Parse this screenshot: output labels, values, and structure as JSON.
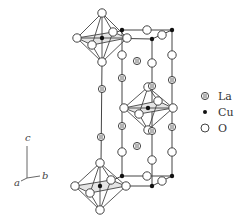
{
  "figure": {
    "type": "crystal-structure"
  },
  "legend": {
    "items": [
      {
        "symbol": "la-atom",
        "label": "La"
      },
      {
        "symbol": "cu-atom",
        "label": "Cu"
      },
      {
        "symbol": "o-atom",
        "label": "O"
      }
    ]
  },
  "axes": {
    "c": "c",
    "a": "a",
    "b": "b"
  },
  "colors": {
    "line": "#444444",
    "atom_fill": "#ffffff",
    "cu_fill": "#111111",
    "background": "#ffffff"
  }
}
